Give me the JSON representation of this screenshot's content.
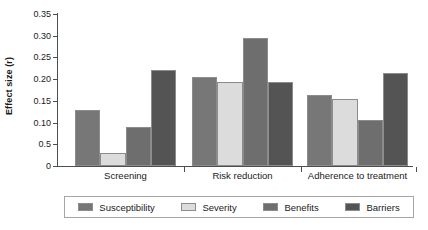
{
  "chart_data": {
    "type": "bar",
    "title": "",
    "xlabel": "",
    "ylabel": "Effect size (r)",
    "categories": [
      "Screening",
      "Risk reduction",
      "Adherence to treatment"
    ],
    "series": [
      {
        "name": "Susceptibility",
        "color": "#777777",
        "values": [
          0.13,
          0.205,
          0.163
        ]
      },
      {
        "name": "Severity",
        "color": "#dcdcdc",
        "values": [
          0.03,
          0.193,
          0.155
        ]
      },
      {
        "name": "Benefits",
        "color": "#6e6e6e",
        "values": [
          0.09,
          0.295,
          0.105
        ]
      },
      {
        "name": "Barriers",
        "color": "#545454",
        "values": [
          0.222,
          0.193,
          0.215
        ]
      }
    ],
    "ylim": [
      0,
      0.35
    ],
    "ytick_values": [
      0.35,
      0.3,
      0.25,
      0.2,
      0.15,
      0.1,
      0.05,
      0
    ],
    "ytick_labels": [
      "0.35",
      "0.30",
      "0.25",
      "0.20",
      "0.15",
      "0.10",
      "0.5",
      "0"
    ],
    "grid": false,
    "legend_position": "bottom",
    "legend_entries": [
      "Susceptibility",
      "Severity",
      "Benefits",
      "Barriers"
    ]
  }
}
